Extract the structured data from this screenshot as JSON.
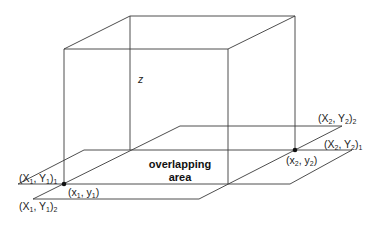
{
  "diagram": {
    "type": "3d-box-with-overlapping-planes",
    "axis_label": "z",
    "region_label_line1": "overlapping",
    "region_label_line2": "area",
    "points": {
      "p1": {
        "label": "(x",
        "sub": "1",
        "mid": ", y",
        "sub2": "1",
        "end": ")"
      },
      "p2": {
        "label": "(x",
        "sub": "2",
        "mid": ", y",
        "sub2": "2",
        "end": ")"
      }
    },
    "corners": {
      "X1Y1_1": {
        "label": "(X",
        "sub": "1",
        "mid": ", Y",
        "sub2": "1",
        "end": ")",
        "outer_sub": "1"
      },
      "X1Y1_2": {
        "label": "(X",
        "sub": "1",
        "mid": ", Y",
        "sub2": "1",
        "end": ")",
        "outer_sub": "2"
      },
      "X2Y2_1": {
        "label": "(X",
        "sub": "2",
        "mid": ", Y",
        "sub2": "2",
        "end": ")",
        "outer_sub": "1"
      },
      "X2Y2_2": {
        "label": "(X",
        "sub": "2",
        "mid": ", Y",
        "sub2": "2",
        "end": ")",
        "outer_sub": "2"
      }
    }
  }
}
